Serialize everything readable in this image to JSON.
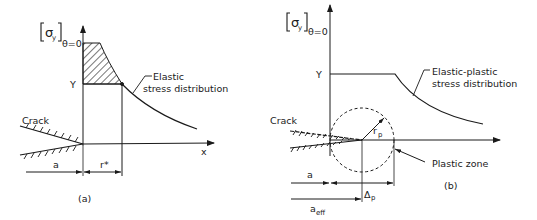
{
  "panel_a": {
    "ylabel_main": "σ",
    "ylabel_sub": "y",
    "ylabel_cond": "θ=0",
    "y_level": "Y",
    "xlabel": "x",
    "crack_label": "Crack",
    "curve_label_line1": "Elastic",
    "curve_label_line2": "stress distribution",
    "dim_a": "a",
    "dim_r": "r*",
    "caption": "(a)"
  },
  "panel_b": {
    "ylabel_main": "σ",
    "ylabel_sub": "y",
    "ylabel_cond": "θ=0",
    "y_level": "Y",
    "crack_label": "Crack",
    "curve_label_line1": "Elastic-plastic",
    "curve_label_line2": "stress distribution",
    "radius_label": "r",
    "radius_sub": "p",
    "zone_label": "Plastic zone",
    "dim_a": "a",
    "dim_delta": "Δ",
    "dim_delta_sub": "p",
    "dim_aeff": "a",
    "dim_aeff_sub": "eff",
    "caption": "(b)"
  },
  "colors": {
    "ink": "#1a1a1a",
    "background": "#ffffff"
  }
}
